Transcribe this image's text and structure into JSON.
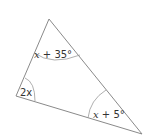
{
  "diagram": {
    "type": "triangle",
    "stroke_color": "#8a8a8a",
    "vertices": {
      "top": {
        "x": 49,
        "y": 19
      },
      "left": {
        "x": 16,
        "y": 96
      },
      "bottom_right": {
        "x": 142,
        "y": 134
      }
    },
    "angles": {
      "top": {
        "var": "x",
        "rest": " + 35°"
      },
      "left": {
        "var": "2x"
      },
      "bottom_right": {
        "var": "x",
        "rest": " + 5°"
      }
    }
  }
}
